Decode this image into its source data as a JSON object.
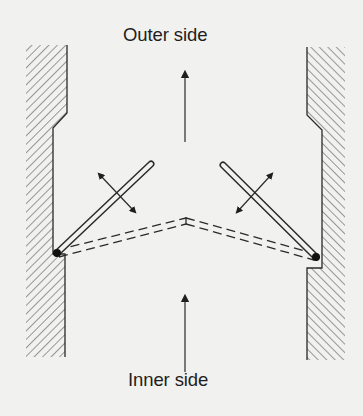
{
  "diagram": {
    "labels": {
      "outer_side": "Outer side",
      "inner_side": "Inner side"
    },
    "elements": {
      "walls": [
        "left-wall",
        "right-wall"
      ],
      "flaps": [
        {
          "side": "left",
          "state_open": "solid",
          "state_closed": "dashed",
          "motion": "double-arrow"
        },
        {
          "side": "right",
          "state_open": "solid",
          "state_closed": "dashed",
          "motion": "double-arrow"
        }
      ],
      "flow_arrows": [
        {
          "position": "upper",
          "direction": "up",
          "toward": "Outer side"
        },
        {
          "position": "lower",
          "direction": "up",
          "from": "Inner side"
        }
      ]
    },
    "colors": {
      "background": "#f1f1ef",
      "ink": "#1e1e1e",
      "hatch": "#4a4a4a"
    }
  }
}
